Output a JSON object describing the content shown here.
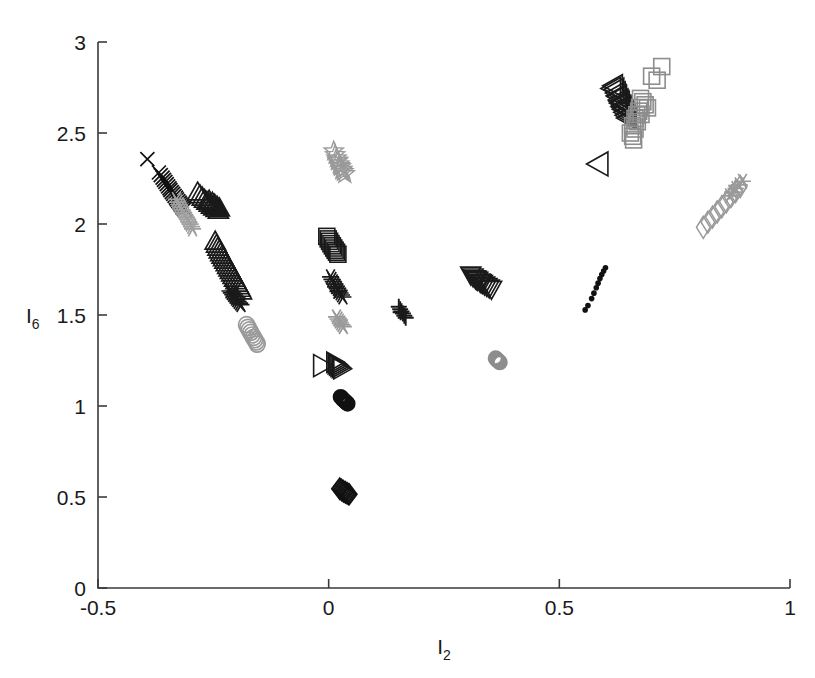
{
  "figure": {
    "title": "",
    "background": "#ffffff",
    "axis_color": "#3a3a3a",
    "width": 815,
    "height": 678
  },
  "axes": {
    "x_label_base": "I",
    "x_label_sub": "2",
    "y_label_base": "I",
    "y_label_sub": "6",
    "x_ticks": [
      "-0.5",
      "0",
      "0.5",
      "1"
    ],
    "x_tick_values": [
      -0.5,
      0,
      0.5,
      1
    ],
    "y_ticks": [
      "0",
      "0.5",
      "1",
      "1.5",
      "2",
      "2.5",
      "3"
    ],
    "y_tick_values": [
      0,
      0.5,
      1,
      1.5,
      2,
      2.5,
      3
    ]
  },
  "chart_data": {
    "type": "scatter",
    "title": "",
    "xlabel": "I2",
    "ylabel": "I6",
    "xlim": [
      -0.5,
      1
    ],
    "ylim": [
      0,
      3
    ],
    "grid": false,
    "legend": "none",
    "colors": {
      "black": "#111111",
      "dark_gray": "#3d3d3d",
      "gray": "#8d8d8d",
      "light_gray": "#a8a8a8"
    },
    "series": [
      {
        "name": "x-marks-upper-left",
        "marker": "x",
        "color": "#111111",
        "points": [
          [
            -0.393,
            2.357
          ],
          [
            -0.368,
            2.283
          ],
          [
            -0.364,
            2.268
          ],
          [
            -0.36,
            2.255
          ],
          [
            -0.357,
            2.243
          ],
          [
            -0.354,
            2.231
          ],
          [
            -0.351,
            2.219
          ],
          [
            -0.348,
            2.207
          ],
          [
            -0.345,
            2.196
          ],
          [
            -0.343,
            2.186
          ],
          [
            -0.34,
            2.175
          ],
          [
            -0.337,
            2.165
          ],
          [
            -0.334,
            2.155
          ],
          [
            -0.331,
            2.145
          ],
          [
            -0.329,
            2.135
          ],
          [
            -0.326,
            2.126
          ],
          [
            -0.323,
            2.117
          ],
          [
            -0.321,
            2.108
          ],
          [
            -0.318,
            2.098
          ],
          [
            -0.316,
            2.089
          ],
          [
            -0.313,
            2.08
          ]
        ]
      },
      {
        "name": "asterisk-gray-upper-left",
        "marker": "star6",
        "color": "#a0a0a0",
        "points": [
          [
            -0.33,
            2.135
          ],
          [
            -0.327,
            2.12
          ],
          [
            -0.324,
            2.106
          ],
          [
            -0.321,
            2.092
          ],
          [
            -0.318,
            2.078
          ],
          [
            -0.315,
            2.064
          ],
          [
            -0.312,
            2.051
          ],
          [
            -0.309,
            2.038
          ],
          [
            -0.306,
            2.025
          ],
          [
            -0.303,
            2.012
          ],
          [
            -0.3,
            1.999
          ],
          [
            -0.297,
            1.986
          ],
          [
            -0.295,
            1.973
          ]
        ]
      },
      {
        "name": "triangle-up-upper-left",
        "marker": "triangle-up",
        "color": "#1a1a1a",
        "points": [
          [
            -0.284,
            2.175
          ],
          [
            -0.279,
            2.16
          ],
          [
            -0.274,
            2.147
          ],
          [
            -0.269,
            2.135
          ],
          [
            -0.264,
            2.124
          ],
          [
            -0.259,
            2.113
          ],
          [
            -0.254,
            2.103
          ],
          [
            -0.249,
            2.093
          ],
          [
            -0.244,
            2.084
          ],
          [
            -0.239,
            2.075
          ],
          [
            -0.252,
            2.119
          ],
          [
            -0.247,
            2.108
          ],
          [
            -0.242,
            2.098
          ],
          [
            -0.237,
            2.088
          ],
          [
            -0.259,
            2.13
          ]
        ]
      },
      {
        "name": "triangle-up-mid-left",
        "marker": "triangle-up",
        "color": "#1a1a1a",
        "points": [
          [
            -0.246,
            1.905
          ],
          [
            -0.243,
            1.888
          ],
          [
            -0.24,
            1.872
          ],
          [
            -0.237,
            1.857
          ],
          [
            -0.234,
            1.842
          ],
          [
            -0.231,
            1.828
          ],
          [
            -0.228,
            1.814
          ],
          [
            -0.225,
            1.8
          ],
          [
            -0.222,
            1.786
          ],
          [
            -0.219,
            1.772
          ],
          [
            -0.216,
            1.758
          ],
          [
            -0.213,
            1.744
          ],
          [
            -0.21,
            1.73
          ],
          [
            -0.207,
            1.716
          ],
          [
            -0.204,
            1.702
          ],
          [
            -0.201,
            1.688
          ],
          [
            -0.198,
            1.674
          ],
          [
            -0.195,
            1.66
          ],
          [
            -0.192,
            1.646
          ],
          [
            -0.189,
            1.632
          ]
        ]
      },
      {
        "name": "asterisk-black-mid-left",
        "marker": "star6",
        "color": "#1a1a1a",
        "points": [
          [
            -0.214,
            1.632
          ],
          [
            -0.211,
            1.622
          ],
          [
            -0.208,
            1.612
          ],
          [
            -0.205,
            1.602
          ],
          [
            -0.202,
            1.592
          ],
          [
            -0.199,
            1.583
          ],
          [
            -0.196,
            1.574
          ],
          [
            -0.193,
            1.565
          ],
          [
            -0.19,
            1.557
          ]
        ]
      },
      {
        "name": "circle-gray-left",
        "marker": "circle",
        "color": "#9a9a9a",
        "points": [
          [
            -0.178,
            1.447
          ],
          [
            -0.175,
            1.432
          ],
          [
            -0.172,
            1.418
          ],
          [
            -0.169,
            1.404
          ],
          [
            -0.166,
            1.39
          ],
          [
            -0.163,
            1.377
          ],
          [
            -0.16,
            1.364
          ],
          [
            -0.157,
            1.352
          ],
          [
            -0.155,
            1.34
          ]
        ]
      },
      {
        "name": "star-gray-upper-mid",
        "marker": "star5",
        "color": "#9a9a9a",
        "points": [
          [
            0.011,
            2.4
          ],
          [
            0.014,
            2.38
          ],
          [
            0.017,
            2.362
          ],
          [
            0.02,
            2.345
          ],
          [
            0.023,
            2.329
          ],
          [
            0.026,
            2.314
          ],
          [
            0.029,
            2.3
          ],
          [
            0.032,
            2.287
          ],
          [
            0.035,
            2.275
          ],
          [
            0.019,
            2.35
          ],
          [
            0.024,
            2.32
          ],
          [
            0.029,
            2.295
          ]
        ]
      },
      {
        "name": "square-black-mid",
        "marker": "square",
        "color": "#1a1a1a",
        "points": [
          [
            -0.004,
            1.932
          ],
          [
            -0.001,
            1.918
          ],
          [
            0.002,
            1.905
          ],
          [
            0.005,
            1.892
          ],
          [
            0.008,
            1.88
          ],
          [
            0.011,
            1.868
          ],
          [
            0.014,
            1.856
          ],
          [
            0.017,
            1.845
          ],
          [
            0.02,
            1.834
          ]
        ]
      },
      {
        "name": "asterisk-black-mid",
        "marker": "star6",
        "color": "#1a1a1a",
        "points": [
          [
            0.004,
            1.71
          ],
          [
            0.007,
            1.696
          ],
          [
            0.01,
            1.683
          ],
          [
            0.013,
            1.67
          ],
          [
            0.016,
            1.657
          ],
          [
            0.019,
            1.645
          ],
          [
            0.022,
            1.633
          ],
          [
            0.025,
            1.621
          ],
          [
            0.028,
            1.61
          ],
          [
            0.031,
            1.599
          ],
          [
            0.015,
            1.655
          ],
          [
            0.02,
            1.63
          ]
        ]
      },
      {
        "name": "asterisk-gray-mid",
        "marker": "star6",
        "color": "#9a9a9a",
        "points": [
          [
            0.017,
            1.49
          ],
          [
            0.02,
            1.478
          ],
          [
            0.023,
            1.467
          ],
          [
            0.026,
            1.456
          ],
          [
            0.029,
            1.446
          ],
          [
            0.032,
            1.436
          ]
        ]
      },
      {
        "name": "triangle-right-open-mid",
        "marker": "triangle-right-open",
        "color": "#1a1a1a",
        "points": [
          [
            -0.014,
            1.222
          ]
        ]
      },
      {
        "name": "triangle-right-filled-mid",
        "marker": "triangle-right",
        "color": "#1a1a1a",
        "points": [
          [
            0.013,
            1.24
          ],
          [
            0.016,
            1.232
          ],
          [
            0.019,
            1.225
          ],
          [
            0.022,
            1.218
          ],
          [
            0.025,
            1.211
          ],
          [
            0.028,
            1.204
          ]
        ]
      },
      {
        "name": "circle-black-mid",
        "marker": "circle-filled",
        "color": "#111111",
        "points": [
          [
            0.026,
            1.05
          ],
          [
            0.029,
            1.042
          ],
          [
            0.032,
            1.034
          ],
          [
            0.035,
            1.027
          ],
          [
            0.038,
            1.02
          ],
          [
            0.041,
            1.013
          ]
        ]
      },
      {
        "name": "diamond-black-lower",
        "marker": "diamond",
        "color": "#111111",
        "points": [
          [
            0.024,
            0.545
          ],
          [
            0.028,
            0.538
          ],
          [
            0.032,
            0.532
          ],
          [
            0.036,
            0.526
          ],
          [
            0.04,
            0.52
          ],
          [
            0.044,
            0.515
          ]
        ]
      },
      {
        "name": "plus-black-mid",
        "marker": "plus",
        "color": "#1a1a1a",
        "points": [
          [
            0.152,
            1.545
          ],
          [
            0.155,
            1.532
          ],
          [
            0.158,
            1.52
          ],
          [
            0.161,
            1.508
          ],
          [
            0.164,
            1.496
          ],
          [
            0.167,
            1.485
          ],
          [
            0.156,
            1.515
          ]
        ]
      },
      {
        "name": "triangle-down-mid-right",
        "marker": "triangle-down",
        "color": "#1a1a1a",
        "points": [
          [
            0.308,
            1.72
          ],
          [
            0.313,
            1.71
          ],
          [
            0.318,
            1.7
          ],
          [
            0.323,
            1.691
          ],
          [
            0.328,
            1.682
          ],
          [
            0.333,
            1.673
          ],
          [
            0.338,
            1.665
          ],
          [
            0.343,
            1.657
          ],
          [
            0.348,
            1.649
          ],
          [
            0.353,
            1.642
          ],
          [
            0.32,
            1.695
          ],
          [
            0.33,
            1.678
          ]
        ]
      },
      {
        "name": "dot-gray-mid-right",
        "marker": "circle-filled",
        "color": "#8d8d8d",
        "points": [
          [
            0.362,
            1.262
          ],
          [
            0.365,
            1.254
          ],
          [
            0.368,
            1.247
          ],
          [
            0.371,
            1.24
          ]
        ]
      },
      {
        "name": "dot-black-right-diag",
        "marker": "dot",
        "color": "#111111",
        "points": [
          [
            0.556,
            1.528
          ],
          [
            0.562,
            1.552
          ],
          [
            0.57,
            1.59
          ],
          [
            0.575,
            1.62
          ],
          [
            0.58,
            1.65
          ],
          [
            0.584,
            1.675
          ],
          [
            0.588,
            1.7
          ],
          [
            0.592,
            1.722
          ],
          [
            0.596,
            1.742
          ],
          [
            0.6,
            1.76
          ]
        ]
      },
      {
        "name": "triangle-left-open-right",
        "marker": "triangle-left-open",
        "color": "#1a1a1a",
        "points": [
          [
            0.585,
            2.33
          ]
        ]
      },
      {
        "name": "triangle-left-black-upper-right",
        "marker": "triangle-left",
        "color": "#1a1a1a",
        "points": [
          [
            0.618,
            2.76
          ],
          [
            0.621,
            2.74
          ],
          [
            0.624,
            2.72
          ],
          [
            0.627,
            2.7
          ],
          [
            0.63,
            2.682
          ],
          [
            0.633,
            2.664
          ],
          [
            0.636,
            2.647
          ],
          [
            0.639,
            2.63
          ],
          [
            0.642,
            2.614
          ],
          [
            0.645,
            2.598
          ],
          [
            0.626,
            2.705
          ],
          [
            0.632,
            2.672
          ],
          [
            0.638,
            2.64
          ],
          [
            0.614,
            2.745
          ],
          [
            0.648,
            2.583
          ]
        ]
      },
      {
        "name": "square-gray-upper-right",
        "marker": "square",
        "color": "#8d8d8d",
        "points": [
          [
            0.722,
            2.865
          ],
          [
            0.7,
            2.812
          ],
          [
            0.712,
            2.79
          ],
          [
            0.676,
            2.69
          ],
          [
            0.681,
            2.672
          ],
          [
            0.686,
            2.655
          ],
          [
            0.691,
            2.638
          ],
          [
            0.672,
            2.62
          ],
          [
            0.677,
            2.602
          ],
          [
            0.664,
            2.58
          ],
          [
            0.669,
            2.562
          ],
          [
            0.659,
            2.54
          ],
          [
            0.664,
            2.522
          ],
          [
            0.654,
            2.5
          ],
          [
            0.659,
            2.482
          ],
          [
            0.661,
            2.462
          ],
          [
            0.668,
            2.6
          ],
          [
            0.674,
            2.64
          ]
        ]
      },
      {
        "name": "diamond-gray-far-right",
        "marker": "diamond-open",
        "color": "#9a9a9a",
        "points": [
          [
            0.812,
            1.982
          ],
          [
            0.822,
            2.01
          ],
          [
            0.832,
            2.038
          ],
          [
            0.842,
            2.066
          ],
          [
            0.852,
            2.094
          ],
          [
            0.862,
            2.122
          ],
          [
            0.872,
            2.15
          ],
          [
            0.882,
            2.178
          ],
          [
            0.892,
            2.206
          ]
        ]
      },
      {
        "name": "asterisk-gray-far-right",
        "marker": "star6",
        "color": "#9a9a9a",
        "points": [
          [
            0.876,
            2.175
          ],
          [
            0.883,
            2.195
          ],
          [
            0.89,
            2.215
          ],
          [
            0.897,
            2.235
          ],
          [
            0.869,
            2.155
          ]
        ]
      }
    ]
  }
}
